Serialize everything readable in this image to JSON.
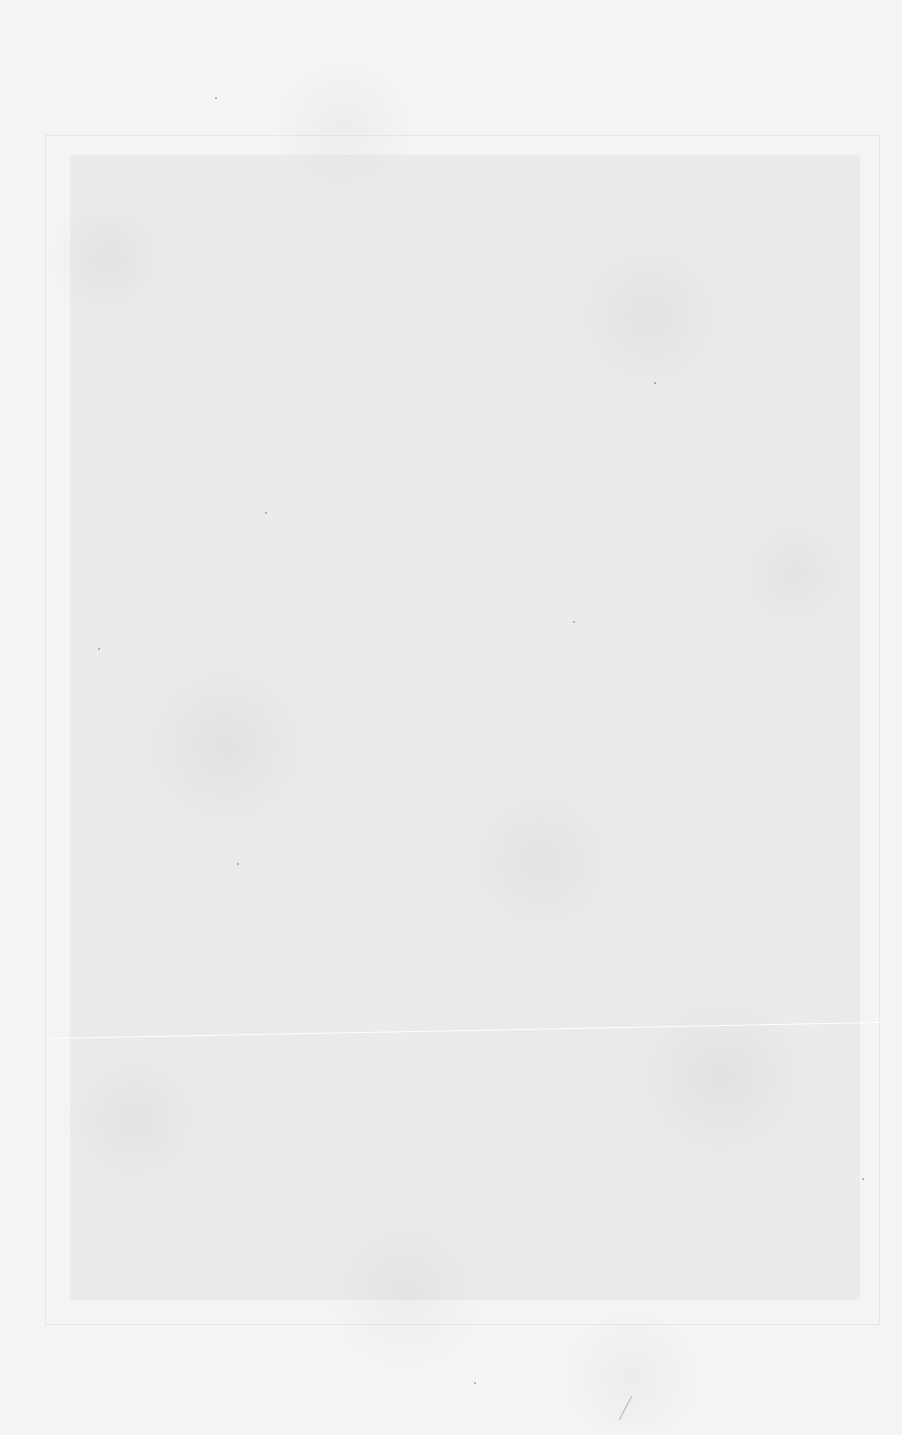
{
  "page": {
    "background_color": "#f4f4f4",
    "plate_mark": {
      "left": 45,
      "top": 135,
      "width": 835,
      "height": 1190
    },
    "image_area": {
      "left": 70,
      "top": 155,
      "width": 790,
      "height": 1145
    },
    "scratch_line": {
      "y": 1038
    },
    "specks": [
      {
        "x": 215,
        "y": 97
      },
      {
        "x": 265,
        "y": 512
      },
      {
        "x": 98,
        "y": 648
      },
      {
        "x": 237,
        "y": 863
      },
      {
        "x": 573,
        "y": 621
      },
      {
        "x": 474,
        "y": 1382
      },
      {
        "x": 862,
        "y": 1178
      },
      {
        "x": 654,
        "y": 382
      }
    ],
    "fibers": [
      {
        "x": 625,
        "y": 1395
      }
    ]
  }
}
